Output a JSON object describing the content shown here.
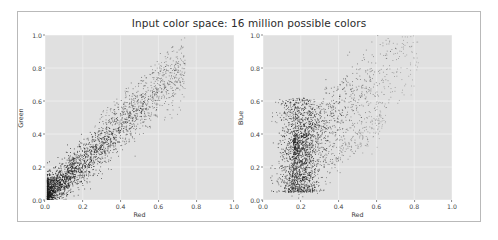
{
  "figure": {
    "title": "Input color space: 16 million possible colors",
    "background": "#ffffff",
    "border_color": "#b9b9b9",
    "axes_facecolor": "#e0e0e0",
    "grid_color": "#f2f2f2",
    "point_color": "#1a1a1a"
  },
  "chart_data": [
    {
      "type": "scatter",
      "title": "Input color space: 16 million possible colors",
      "xlabel": "Red",
      "ylabel": "Green",
      "xlim": [
        0.0,
        1.0
      ],
      "ylim": [
        0.0,
        1.0
      ],
      "xticks": [
        "0.0",
        "0.2",
        "0.4",
        "0.6",
        "0.8",
        "1.0"
      ],
      "yticks": [
        "0.0",
        "0.2",
        "0.4",
        "0.6",
        "0.8",
        "1.0"
      ],
      "xtick_values": [
        0.0,
        0.2,
        0.4,
        0.6,
        0.8,
        1.0
      ],
      "ytick_values": [
        0.0,
        0.2,
        0.4,
        0.6,
        0.8,
        1.0
      ],
      "grid": true,
      "legend": "none",
      "marker": ".",
      "marker_size": 1,
      "n_points": 2600,
      "description": "Tight positively-correlated diagonal band of pixel colors from red channel versus green channel; density peaks near (0.15, 0.15) and the band thins toward (0.7, 0.78).",
      "cloud": {
        "model": "diagonal-band",
        "x_start": 0.01,
        "x_end": 0.74,
        "slope": 1.06,
        "intercept": 0.02,
        "spread_low": 0.055,
        "spread_high": 0.085,
        "density_bias": 2.1
      }
    },
    {
      "type": "scatter",
      "xlabel": "Red",
      "ylabel": "Blue",
      "xlim": [
        0.0,
        1.0
      ],
      "ylim": [
        0.0,
        1.0
      ],
      "xticks": [
        "0.0",
        "0.2",
        "0.4",
        "0.6",
        "0.8",
        "1.0"
      ],
      "yticks": [
        "0.0",
        "0.2",
        "0.4",
        "0.6",
        "0.8",
        "1.0"
      ],
      "xtick_values": [
        0.0,
        0.2,
        0.4,
        0.6,
        0.8,
        1.0
      ],
      "ytick_values": [
        0.0,
        0.2,
        0.4,
        0.6,
        0.8,
        1.0
      ],
      "grid": true,
      "legend": "none",
      "marker": ".",
      "marker_size": 1,
      "n_points": 2600,
      "description": "Broad fan-shaped cloud of red channel versus blue channel; a dense vertical core near Red 0.12-0.28 spanning Blue 0.05-0.6, with an upper branch rising toward (0.8, 0.88) and a sparser lower branch.",
      "cloud": {
        "model": "fan",
        "core_x": 0.19,
        "core_x_spread": 0.055,
        "core_y_low": 0.05,
        "core_y_high": 0.62,
        "branch_x_end": 0.82,
        "branch_slope": 1.0,
        "branch_intercept": 0.16,
        "branch_spread": 0.11,
        "density_bias": 2.4
      }
    }
  ]
}
